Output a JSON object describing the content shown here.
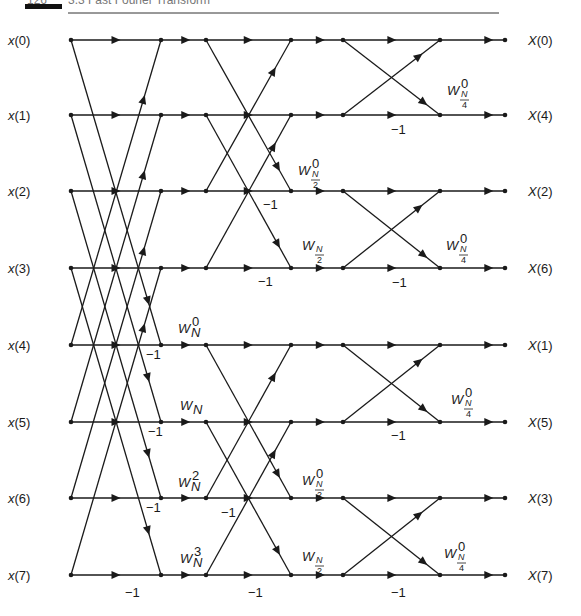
{
  "header": {
    "page_number": "126",
    "running_title": "3.3 Fast Fourier Transform",
    "bar_color": "#111111"
  },
  "figure": {
    "line_color": "#1a1a1a",
    "rows_y": [
      40,
      115,
      191,
      268,
      345,
      422,
      498,
      575
    ],
    "columns_x": [
      71,
      161,
      206,
      291,
      343,
      440,
      505
    ],
    "inputs": [
      "x(0)",
      "x(1)",
      "x(2)",
      "x(3)",
      "x(4)",
      "x(5)",
      "x(6)",
      "x(7)"
    ],
    "outputs": [
      "X(0)",
      "X(4)",
      "X(2)",
      "X(6)",
      "X(1)",
      "X(5)",
      "X(3)",
      "X(7)"
    ],
    "stages": [
      {
        "name": "stage-1",
        "span": 4,
        "from_col": 0,
        "to_col": 1
      },
      {
        "name": "stage-2",
        "span": 2,
        "from_col": 2,
        "to_col": 3
      },
      {
        "name": "stage-3",
        "span": 1,
        "from_col": 4,
        "to_col": 5
      }
    ],
    "twiddles": [
      {
        "base": "W",
        "sub": "N",
        "sup": "0",
        "x": 178,
        "y": 333
      },
      {
        "base": "W",
        "sub": "N",
        "sup": "",
        "x": 180,
        "y": 410
      },
      {
        "base": "W",
        "sub": "N",
        "sup": "2",
        "x": 178,
        "y": 487
      },
      {
        "base": "W",
        "sub": "N",
        "sup": "3",
        "x": 180,
        "y": 563
      },
      {
        "base": "W",
        "sub": "N/2",
        "sup": "0",
        "x": 298,
        "y": 175
      },
      {
        "base": "W",
        "sub": "N/2",
        "sup": "",
        "x": 302,
        "y": 250
      },
      {
        "base": "W",
        "sub": "N/2",
        "sup": "0",
        "x": 302,
        "y": 485
      },
      {
        "base": "W",
        "sub": "N/2",
        "sup": "",
        "x": 302,
        "y": 561
      },
      {
        "base": "W",
        "sub": "N/4",
        "sup": "0",
        "x": 447,
        "y": 95
      },
      {
        "base": "W",
        "sub": "N/4",
        "sup": "0",
        "x": 446,
        "y": 250
      },
      {
        "base": "W",
        "sub": "N/4",
        "sup": "0",
        "x": 451,
        "y": 404
      },
      {
        "base": "W",
        "sub": "N/4",
        "sup": "0",
        "x": 444,
        "y": 558
      }
    ],
    "minus_one_labels": [
      {
        "text": "−1",
        "x": 146,
        "y": 359
      },
      {
        "text": "−1",
        "x": 148,
        "y": 436
      },
      {
        "text": "−1",
        "x": 146,
        "y": 512
      },
      {
        "text": "−1",
        "x": 125,
        "y": 597
      },
      {
        "text": "−1",
        "x": 263,
        "y": 209
      },
      {
        "text": "−1",
        "x": 221,
        "y": 517
      },
      {
        "text": "−1",
        "x": 258,
        "y": 286
      },
      {
        "text": "−1",
        "x": 248,
        "y": 597
      },
      {
        "text": "−1",
        "x": 391,
        "y": 134
      },
      {
        "text": "−1",
        "x": 392,
        "y": 287
      },
      {
        "text": "−1",
        "x": 391,
        "y": 440
      },
      {
        "text": "−1",
        "x": 391,
        "y": 597
      }
    ]
  }
}
